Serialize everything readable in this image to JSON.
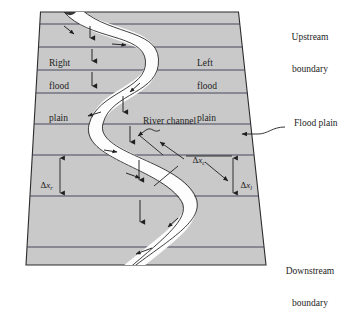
{
  "figure": {
    "colors": {
      "flood_plain_fill": "#c9c9c9",
      "channel_fill": "#fdfdfd",
      "outline": "#2b2b2b",
      "section_line": "#3a3a50",
      "background": "#ffffff",
      "text": "#1d1d1d"
    }
  },
  "labels": {
    "upstream_boundary": {
      "line1": "Upstream",
      "line2": "boundary"
    },
    "downstream_boundary": {
      "line1": "Downstream",
      "line2": "boundary"
    },
    "right_flood_plain": {
      "line1": "Right",
      "line2": "flood",
      "line3": "plain"
    },
    "left_flood_plain": {
      "line1": "Left",
      "line2": "flood",
      "line3": "plain"
    },
    "river_channel": "River channel",
    "flood_plain": "Flood plain"
  },
  "dimensions": {
    "delta": "Δ",
    "x": "x",
    "right_subscript": "r",
    "channel_subscript": "c",
    "left_subscript": "l",
    "right_full": "Δx r",
    "channel_full": "Δx c",
    "left_full": "Δx l"
  },
  "geometry": {
    "cross_section_count": 8,
    "flow_arrow_count": 12,
    "channel_meanders": 2
  }
}
